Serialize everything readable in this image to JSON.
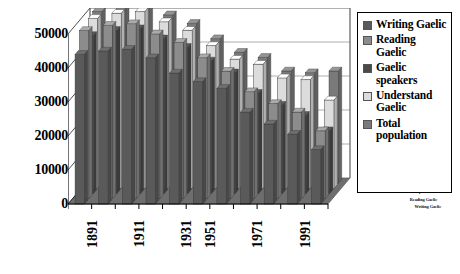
{
  "chart_data": {
    "type": "bar",
    "title": "",
    "subtitle": "",
    "xlabel": "",
    "ylabel": "",
    "ylim": [
      0,
      50000
    ],
    "yticks": [
      0,
      10000,
      20000,
      30000,
      40000,
      50000
    ],
    "ytick_labels": [
      "0",
      "10000",
      "20000",
      "30000",
      "40000",
      "50000"
    ],
    "grid": true,
    "legend_position": "right",
    "projection": "3d",
    "categories": [
      "1891",
      "1901",
      "1911",
      "1921",
      "1931",
      "1951",
      "1961",
      "1971",
      "1981",
      "1991",
      "2001"
    ],
    "xtick_labels_shown": [
      "1891",
      "1911",
      "1931",
      "1951",
      "1971",
      "1991"
    ],
    "z_axis_labels": [
      "Total population",
      "Understand Gaelic",
      "Gaelic speakers",
      "Reading Gaelic",
      "Writing Gaelic"
    ],
    "series": [
      {
        "name": "Writing Gaelic",
        "color": "#5a5a5a",
        "values": [
          44000,
          45000,
          45500,
          43000,
          38500,
          36000,
          34000,
          27000,
          23500,
          20500,
          16000
        ]
      },
      {
        "name": "Reading Gaelic",
        "color": "#8c8c8c",
        "values": [
          49500,
          51000,
          51500,
          48500,
          46000,
          41500,
          37500,
          31500,
          28000,
          25500,
          20000
        ]
      },
      {
        "name": "Gaelic speakers",
        "color": "#4a4a4a",
        "values": [
          46500,
          48000,
          48500,
          45500,
          43000,
          39000,
          35500,
          29500,
          26000,
          23000,
          18500
        ]
      },
      {
        "name": "Understand Gaelic",
        "color": "#dcdcdc",
        "values": [
          50000,
          51500,
          52000,
          49000,
          46500,
          42000,
          38000,
          36500,
          32500,
          32000,
          26000
        ]
      },
      {
        "name": "Total population",
        "color": "#7a7a7a",
        "values": [
          50500,
          52000,
          52500,
          49500,
          47000,
          42500,
          38500,
          37000,
          33000,
          32500,
          33000
        ]
      }
    ]
  },
  "legend": {
    "items": [
      {
        "label": "Writing Gaelic",
        "color": "#5a5a5a"
      },
      {
        "label": "Reading Gaelic",
        "color": "#8c8c8c"
      },
      {
        "label": "Gaelic speakers",
        "color": "#4a4a4a"
      },
      {
        "label": "Understand Gaelic",
        "color": "#dcdcdc"
      },
      {
        "label": "Total population",
        "color": "#7a7a7a"
      }
    ]
  },
  "style": {
    "floor_color": "#6e6e6e",
    "back_wall_color": "#ffffff",
    "axis_line_color": "#000000",
    "grid_color": "#999999",
    "plot_border_color": "#666666"
  }
}
